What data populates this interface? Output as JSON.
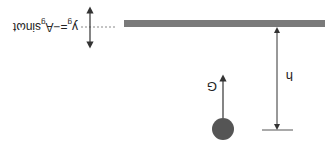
{
  "figure": {
    "orientation": "rotated 180 degrees",
    "ground_equation": {
      "y": "y",
      "y_sub": "g",
      "eq": "=−A",
      "A_sub": "g",
      "rest": "sinωt"
    },
    "force_label": "G",
    "height_label": "h",
    "colors": {
      "bar": "#7a7a7a",
      "ball": "#555555",
      "line": "#333333",
      "dotted": "#888888"
    }
  }
}
